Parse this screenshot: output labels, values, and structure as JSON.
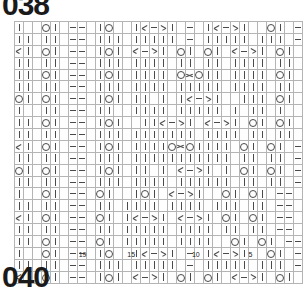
{
  "page": {
    "top_number": "038",
    "bottom_number": "040"
  },
  "chart_data": {
    "type": "table",
    "columns": 34,
    "rows": 22,
    "legend": [
      {
        "key": "k",
        "symbol": "|",
        "label": "knit"
      },
      {
        "key": "p",
        "symbol": "—",
        "label": "purl"
      },
      {
        "key": "o",
        "symbol": "O",
        "label": "yarn over"
      },
      {
        "key": "ssk",
        "symbol": "╱|",
        "label": "left-leaning decrease"
      },
      {
        "key": "k2",
        "symbol": "|╲",
        "label": "right-leaning decrease"
      },
      {
        "key": "cdd",
        "symbol": "╳",
        "label": "central double decrease"
      },
      {
        "key": "g",
        "symbol": "█",
        "label": "no stitch / shaded"
      },
      {
        "key": "e",
        "symbol": "",
        "label": "empty"
      }
    ],
    "colors": {
      "grid_line": "#b4b4b4",
      "symbol": "#4a4a4a",
      "shade_fill": "#b9b9b9",
      "cell_fill": "#fefefe",
      "title_text": "#1a1a1a"
    },
    "row_number_labels": [
      {
        "text": "19",
        "col_index": 8
      },
      {
        "text": "15",
        "col_index": 14
      },
      {
        "text": "10",
        "col_index": 22
      },
      {
        "text": "5",
        "col_index": 29
      }
    ],
    "grid": [
      [
        "k",
        "g",
        "e",
        "o",
        "k",
        "e",
        "p",
        "p",
        "e",
        "k",
        "o",
        "g",
        "e",
        "k",
        "ssk",
        "p",
        "k2",
        "k",
        "e",
        "p",
        "e",
        "k",
        "ssk",
        "p",
        "k2",
        "k",
        "e",
        "g",
        "o",
        "k",
        "e",
        "p",
        "p",
        "e",
        "e"
      ],
      [
        "k",
        "k",
        "e",
        "k",
        "k",
        "e",
        "p",
        "p",
        "e",
        "k",
        "k",
        "k",
        "e",
        "k",
        "k",
        "k",
        "k",
        "k",
        "e",
        "p",
        "e",
        "k",
        "k",
        "k",
        "k",
        "k",
        "e",
        "k",
        "k",
        "k",
        "e",
        "p",
        "p",
        "e",
        "e"
      ],
      [
        "ssk",
        "k",
        "e",
        "o",
        "k",
        "e",
        "p",
        "p",
        "e",
        "k",
        "o",
        "k",
        "e",
        "ssk",
        "p",
        "k2",
        "k",
        "e",
        "o",
        "k",
        "e",
        "o",
        "k",
        "e",
        "ssk",
        "p",
        "k2",
        "k",
        "e",
        "o",
        "k",
        "e",
        "p",
        "p",
        "e"
      ],
      [
        "k",
        "k",
        "e",
        "k",
        "k",
        "e",
        "p",
        "p",
        "e",
        "k",
        "k",
        "k",
        "e",
        "k",
        "k",
        "k",
        "k",
        "e",
        "k",
        "k",
        "e",
        "k",
        "k",
        "e",
        "k",
        "k",
        "k",
        "k",
        "e",
        "k",
        "k",
        "e",
        "p",
        "p",
        "e"
      ],
      [
        "k",
        "k",
        "e",
        "o",
        "k",
        "e",
        "p",
        "p",
        "e",
        "k",
        "o",
        "k",
        "e",
        "k",
        "k",
        "k",
        "k",
        "e",
        "o",
        "cdd",
        "o",
        "k",
        "k",
        "e",
        "k",
        "k",
        "k",
        "k",
        "e",
        "o",
        "k",
        "e",
        "p",
        "p",
        "e"
      ],
      [
        "k",
        "k",
        "e",
        "k",
        "k",
        "e",
        "p",
        "p",
        "e",
        "k",
        "k",
        "k",
        "e",
        "k",
        "k",
        "k",
        "k",
        "e",
        "k",
        "k",
        "k",
        "k",
        "k",
        "e",
        "k",
        "k",
        "k",
        "k",
        "e",
        "k",
        "k",
        "e",
        "p",
        "p",
        "e"
      ],
      [
        "o",
        "k",
        "e",
        "o",
        "k",
        "e",
        "p",
        "p",
        "e",
        "k",
        "o",
        "k",
        "e",
        "k",
        "k",
        "g",
        "k",
        "e",
        "k",
        "ssk",
        "p",
        "k2",
        "k",
        "e",
        "g",
        "k",
        "k",
        "k",
        "e",
        "o",
        "k",
        "e",
        "p",
        "p",
        "e"
      ],
      [
        "k",
        "g",
        "e",
        "k",
        "k",
        "e",
        "p",
        "p",
        "e",
        "k",
        "k",
        "g",
        "e",
        "k",
        "k",
        "k",
        "k",
        "e",
        "k",
        "k",
        "k",
        "k",
        "k",
        "e",
        "k",
        "g",
        "k",
        "k",
        "e",
        "k",
        "g",
        "e",
        "p",
        "p",
        "e"
      ],
      [
        "k",
        "k",
        "e",
        "o",
        "k",
        "e",
        "p",
        "p",
        "e",
        "k",
        "o",
        "k",
        "e",
        "g",
        "k",
        "k",
        "ssk",
        "p",
        "k2",
        "k",
        "e",
        "ssk",
        "p",
        "k2",
        "k",
        "e",
        "o",
        "k",
        "e",
        "o",
        "k",
        "e",
        "p",
        "p",
        "e"
      ],
      [
        "k",
        "k",
        "e",
        "k",
        "k",
        "e",
        "p",
        "p",
        "e",
        "k",
        "k",
        "k",
        "e",
        "k",
        "k",
        "k",
        "k",
        "k",
        "k",
        "k",
        "e",
        "k",
        "k",
        "k",
        "k",
        "e",
        "k",
        "k",
        "e",
        "k",
        "k",
        "e",
        "p",
        "p",
        "e"
      ],
      [
        "ssk",
        "k",
        "e",
        "o",
        "k",
        "e",
        "p",
        "p",
        "e",
        "k",
        "o",
        "k",
        "e",
        "k",
        "k",
        "k",
        "k",
        "o",
        "cdd",
        "o",
        "k",
        "k",
        "k",
        "k",
        "e",
        "o",
        "k",
        "e",
        "o",
        "k",
        "e",
        "p",
        "p",
        "e",
        "e"
      ],
      [
        "k",
        "k",
        "e",
        "k",
        "k",
        "e",
        "p",
        "p",
        "e",
        "k",
        "k",
        "k",
        "e",
        "k",
        "k",
        "k",
        "k",
        "k",
        "k",
        "k",
        "k",
        "k",
        "k",
        "k",
        "e",
        "k",
        "k",
        "e",
        "k",
        "k",
        "e",
        "p",
        "p",
        "e",
        "e"
      ],
      [
        "o",
        "k",
        "e",
        "o",
        "k",
        "e",
        "p",
        "p",
        "e",
        "k",
        "o",
        "k",
        "e",
        "k",
        "k",
        "g",
        "k",
        "e",
        "ssk",
        "p",
        "k2",
        "k",
        "g",
        "k",
        "e",
        "o",
        "k",
        "e",
        "o",
        "k",
        "e",
        "p",
        "p",
        "e",
        "e"
      ],
      [
        "k",
        "k",
        "e",
        "k",
        "k",
        "e",
        "p",
        "p",
        "e",
        "k",
        "k",
        "k",
        "e",
        "k",
        "k",
        "k",
        "k",
        "e",
        "k",
        "k",
        "k",
        "k",
        "k",
        "k",
        "e",
        "k",
        "k",
        "e",
        "k",
        "k",
        "e",
        "p",
        "p",
        "e",
        "e"
      ],
      [
        "k",
        "g",
        "e",
        "o",
        "k",
        "e",
        "p",
        "p",
        "e",
        "o",
        "k",
        "e",
        "g",
        "k",
        "o",
        "k",
        "e",
        "ssk",
        "p",
        "k2",
        "k",
        "e",
        "g",
        "o",
        "k",
        "e",
        "o",
        "k",
        "e",
        "p",
        "p",
        "e",
        "e",
        "e",
        "e"
      ],
      [
        "k",
        "k",
        "e",
        "k",
        "k",
        "e",
        "p",
        "p",
        "e",
        "k",
        "k",
        "e",
        "k",
        "k",
        "k",
        "k",
        "e",
        "k",
        "k",
        "k",
        "k",
        "e",
        "k",
        "k",
        "k",
        "e",
        "k",
        "k",
        "e",
        "p",
        "p",
        "e",
        "e",
        "e",
        "e"
      ],
      [
        "ssk",
        "k",
        "e",
        "o",
        "k",
        "e",
        "p",
        "p",
        "e",
        "o",
        "k",
        "e",
        "k",
        "ssk",
        "p",
        "k2",
        "k",
        "e",
        "ssk",
        "p",
        "k2",
        "k",
        "e",
        "o",
        "k",
        "e",
        "o",
        "k",
        "e",
        "p",
        "p",
        "e",
        "e",
        "e",
        "e"
      ],
      [
        "k",
        "k",
        "e",
        "k",
        "k",
        "e",
        "p",
        "p",
        "e",
        "k",
        "k",
        "e",
        "k",
        "k",
        "k",
        "k",
        "k",
        "e",
        "k",
        "k",
        "k",
        "k",
        "e",
        "k",
        "k",
        "e",
        "k",
        "k",
        "e",
        "p",
        "p",
        "e",
        "e",
        "e",
        "e"
      ],
      [
        "k",
        "k",
        "e",
        "o",
        "k",
        "e",
        "p",
        "p",
        "e",
        "o",
        "k",
        "e",
        "k",
        "k",
        "k",
        "k",
        "k",
        "e",
        "k",
        "k",
        "k",
        "k",
        "e",
        "g",
        "o",
        "k",
        "e",
        "o",
        "k",
        "e",
        "p",
        "p",
        "e",
        "e",
        "e"
      ],
      [
        "k",
        "g",
        "e",
        "o",
        "k",
        "e",
        "p",
        "p",
        "e",
        "k",
        "o",
        "g",
        "e",
        "k",
        "ssk",
        "p",
        "k2",
        "k",
        "e",
        "p",
        "e",
        "k",
        "ssk",
        "p",
        "k2",
        "k",
        "e",
        "g",
        "o",
        "k",
        "e",
        "p",
        "p",
        "e",
        "e"
      ],
      [
        "k",
        "k",
        "e",
        "k",
        "k",
        "e",
        "p",
        "p",
        "e",
        "k",
        "k",
        "k",
        "e",
        "k",
        "k",
        "k",
        "k",
        "k",
        "e",
        "p",
        "e",
        "k",
        "k",
        "k",
        "k",
        "k",
        "e",
        "k",
        "k",
        "k",
        "e",
        "p",
        "p",
        "e",
        "e"
      ],
      [
        "ssk",
        "k",
        "e",
        "o",
        "k",
        "e",
        "p",
        "p",
        "e",
        "k",
        "o",
        "k",
        "e",
        "ssk",
        "p",
        "k2",
        "k",
        "e",
        "o",
        "k",
        "e",
        "o",
        "k",
        "e",
        "ssk",
        "p",
        "k2",
        "k",
        "e",
        "o",
        "k",
        "e",
        "p",
        "p",
        "e"
      ]
    ]
  }
}
